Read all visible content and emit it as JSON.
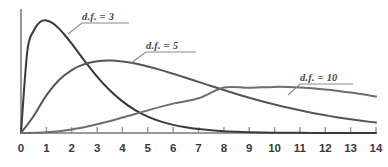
{
  "chart_data": {
    "type": "line",
    "title": "",
    "subtitle": "",
    "xlabel": "",
    "ylabel": "",
    "xlim": [
      0,
      14
    ],
    "ylim": [
      0,
      0.26
    ],
    "grid": false,
    "legend_position": "inline-annotations",
    "x_tick_labels": [
      "0",
      "1",
      "2",
      "3",
      "4",
      "5",
      "6",
      "7",
      "8",
      "9",
      "10",
      "11",
      "12",
      "13",
      "14"
    ],
    "x_ticks": [
      0,
      1,
      2,
      3,
      4,
      5,
      6,
      7,
      8,
      9,
      10,
      11,
      12,
      13,
      14
    ],
    "y_ticks": [],
    "y_tick_labels": [],
    "annotations": [
      {
        "text": "d.f. = 3",
        "series": "df3",
        "points_to_x": 1.85,
        "points_to_y": 0.148
      },
      {
        "text": "d.f. = 5",
        "series": "df5",
        "points_to_x": 4.05,
        "points_to_y": 0.125
      },
      {
        "text": "d.f. = 10",
        "series": "df10",
        "points_to_x": 10.6,
        "points_to_y": 0.072
      }
    ],
    "series": [
      {
        "name": "d.f. = 3",
        "df": 3,
        "color": "#3a3a3a",
        "peak_x": 1.0,
        "peak_y": 0.242,
        "x": [
          0,
          0.25,
          0.5,
          0.75,
          1,
          1.25,
          1.5,
          1.75,
          2,
          2.5,
          3,
          3.5,
          4,
          4.5,
          5,
          5.5,
          6,
          6.5,
          7,
          7.5,
          8,
          8.5,
          9,
          9.5,
          10,
          10.5,
          11,
          11.5,
          12,
          12.5,
          13,
          13.5,
          14
        ],
        "values": [
          0,
          0.176,
          0.2197,
          0.2384,
          0.242,
          0.236,
          0.2242,
          0.209,
          0.1919,
          0.1556,
          0.1213,
          0.0918,
          0.0679,
          0.0493,
          0.0353,
          0.025,
          0.0175,
          0.0122,
          0.0084,
          0.0058,
          0.0039,
          0.0027,
          0.0018,
          0.0012,
          0.0008,
          0.0005,
          0.0004,
          0.0002,
          0.0002,
          0.0001,
          0.0001,
          0.0,
          0.0
        ]
      },
      {
        "name": "d.f. = 5",
        "df": 5,
        "color": "#555555",
        "peak_x": 3.0,
        "peak_y": 0.1542,
        "x": [
          0,
          0.5,
          1,
          1.5,
          2,
          2.5,
          3,
          3.5,
          4,
          4.5,
          5,
          5.5,
          6,
          6.5,
          7,
          7.5,
          8,
          8.5,
          9,
          9.5,
          10,
          10.5,
          11,
          11.5,
          12,
          12.5,
          13,
          13.5,
          14
        ],
        "values": [
          0,
          0.0366,
          0.0807,
          0.1139,
          0.1353,
          0.148,
          0.1542,
          0.1556,
          0.1537,
          0.1493,
          0.143,
          0.1356,
          0.1274,
          0.1187,
          0.1098,
          0.101,
          0.0923,
          0.0839,
          0.0759,
          0.0684,
          0.0613,
          0.0547,
          0.0487,
          0.0431,
          0.0381,
          0.0335,
          0.0294,
          0.0257,
          0.0224
        ]
      },
      {
        "name": "d.f. = 10",
        "df": 10,
        "color": "#6e6e6e",
        "peak_x": 8.0,
        "peak_y": 0.0977,
        "x": [
          0,
          1,
          2,
          3,
          4,
          5,
          6,
          7,
          8,
          9,
          10,
          11,
          12,
          13,
          14
        ],
        "values": [
          0,
          0.0016,
          0.0077,
          0.0189,
          0.0332,
          0.0487,
          0.0631,
          0.0746,
          0.0977,
          0.097,
          0.0991,
          0.0979,
          0.0936,
          0.0868,
          0.0783
        ]
      }
    ]
  },
  "axes": {
    "x_axis_name": "horizontal-value-axis",
    "y_axis_name": "vertical-density-axis",
    "axis_color": "#9a9a9a",
    "tick_color": "#9a9a9a"
  },
  "labels": {
    "df3": "d.f. = 3",
    "df5": "d.f. = 5",
    "df10": "d.f. = 10"
  },
  "x_ticks": {
    "t0": "0",
    "t1": "1",
    "t2": "2",
    "t3": "3",
    "t4": "4",
    "t5": "5",
    "t6": "6",
    "t7": "7",
    "t8": "8",
    "t9": "9",
    "t10": "10",
    "t11": "11",
    "t12": "12",
    "t13": "13",
    "t14": "14"
  }
}
